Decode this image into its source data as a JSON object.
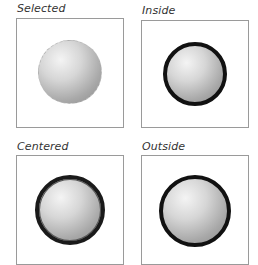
{
  "panels": [
    {
      "id": "selected",
      "label": "Selected",
      "stroke": "none"
    },
    {
      "id": "inside",
      "label": "Inside",
      "stroke": "inside"
    },
    {
      "id": "centered",
      "label": "Centered",
      "stroke": "centered"
    },
    {
      "id": "outside",
      "label": "Outside",
      "stroke": "outside"
    }
  ],
  "colors": {
    "stroke": "#111111",
    "frame": "#9a9a9a",
    "label": "#333333"
  }
}
